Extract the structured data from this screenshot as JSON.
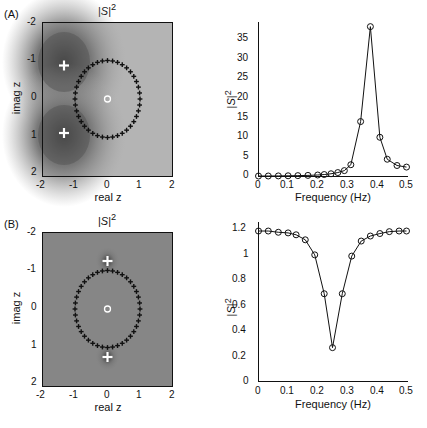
{
  "figure": {
    "panels": [
      {
        "letter": "(A)",
        "zplane": {
          "title": "|S|^2",
          "xlabel": "real z",
          "ylabel": "imag z",
          "xticks": [
            "-2",
            "-1",
            "0",
            "1",
            "2"
          ],
          "yticks": [
            "-2",
            "-1",
            "0",
            "1",
            "2"
          ],
          "xlim": [
            -2,
            2
          ],
          "ylim": [
            -2,
            2
          ],
          "y_inverted": true,
          "background": "grayscale |S|^2 magnitude map, dark near poles",
          "unit_circle_marker": "+",
          "unit_circle_count": 40,
          "zero_marker": "o",
          "zeros": [
            [
              0,
              0
            ]
          ],
          "pole_marker": "+",
          "pole_color": "#ffffff",
          "poles": [
            [
              -0.72,
              -0.9
            ],
            [
              -0.72,
              0.9
            ]
          ]
        },
        "spectrum": {
          "title": "",
          "xlabel": "Frequency (Hz)",
          "ylabel": "|S|^2",
          "xticks": [
            0,
            0.1,
            0.2,
            0.3,
            0.4,
            0.5
          ],
          "yticks": [
            0,
            5,
            10,
            15,
            20,
            25,
            30,
            35
          ],
          "xlim": [
            0,
            0.5
          ],
          "ylim": [
            0,
            39
          ]
        }
      },
      {
        "letter": "(B)",
        "zplane": {
          "title": "|S|^2",
          "xlabel": "real z",
          "ylabel": "imag z",
          "xticks": [
            "-2",
            "-1",
            "0",
            "1",
            "2"
          ],
          "yticks": [
            "-2",
            "-1",
            "0",
            "1",
            "2"
          ],
          "xlim": [
            -2,
            2
          ],
          "ylim": [
            -2,
            2
          ],
          "y_inverted": true,
          "background": "grayscale |S|^2 magnitude map, nearly uniform mid-gray",
          "unit_circle_marker": "+",
          "unit_circle_count": 40,
          "zero_marker": "o",
          "zeros": [
            [
              0,
              0
            ]
          ],
          "pole_marker": "+",
          "pole_color": "#ffffff",
          "poles": [
            [
              0,
              -1.25
            ],
            [
              0,
              1.25
            ]
          ]
        },
        "spectrum": {
          "title": "",
          "xlabel": "Frequency (Hz)",
          "ylabel": "|S|^2",
          "xticks": [
            0,
            0.1,
            0.2,
            0.3,
            0.4,
            0.5
          ],
          "yticks": [
            0,
            0.2,
            0.4,
            0.6,
            0.8,
            1,
            1.2
          ],
          "xlim": [
            0,
            0.5
          ],
          "ylim": [
            0,
            1.26
          ]
        }
      }
    ]
  },
  "chart_data": [
    {
      "type": "line",
      "panel": "(A)",
      "subplot": "spectrum",
      "title": "",
      "xlabel": "Frequency (Hz)",
      "ylabel": "|S|^2",
      "xlim": [
        0,
        0.5
      ],
      "ylim": [
        0,
        39
      ],
      "xticks": [
        0,
        0.1,
        0.2,
        0.3,
        0.4,
        0.5
      ],
      "yticks": [
        0,
        5,
        10,
        15,
        20,
        25,
        30,
        35
      ],
      "grid": false,
      "legend": null,
      "marker": "o",
      "x": [
        0.0,
        0.033,
        0.067,
        0.1,
        0.133,
        0.167,
        0.2,
        0.222,
        0.245,
        0.268,
        0.29,
        0.312,
        0.345,
        0.378,
        0.41,
        0.435,
        0.468,
        0.5
      ],
      "values": [
        0.12,
        0.13,
        0.15,
        0.18,
        0.22,
        0.28,
        0.38,
        0.5,
        0.7,
        1.0,
        1.5,
        3.0,
        14.0,
        38.2,
        10.0,
        4.4,
        2.8,
        2.4
      ],
      "annotations": [
        "sharp resonance peak near 0.378 Hz reaching about 38"
      ]
    },
    {
      "type": "line",
      "panel": "(B)",
      "subplot": "spectrum",
      "title": "",
      "xlabel": "Frequency (Hz)",
      "ylabel": "|S|^2",
      "xlim": [
        0,
        0.5
      ],
      "ylim": [
        0,
        1.26
      ],
      "xticks": [
        0,
        0.1,
        0.2,
        0.3,
        0.4,
        0.5
      ],
      "yticks": [
        0,
        0.2,
        0.4,
        0.6,
        0.8,
        1.0,
        1.2
      ],
      "grid": false,
      "legend": null,
      "marker": "o",
      "x": [
        0.0,
        0.033,
        0.067,
        0.1,
        0.127,
        0.158,
        0.19,
        0.222,
        0.25,
        0.283,
        0.315,
        0.347,
        0.378,
        0.41,
        0.442,
        0.475,
        0.5
      ],
      "values": [
        1.2,
        1.2,
        1.19,
        1.185,
        1.17,
        1.13,
        1.01,
        0.7,
        0.27,
        0.7,
        1.0,
        1.12,
        1.16,
        1.18,
        1.195,
        1.2,
        1.2
      ],
      "annotations": [
        "notch minimum about 0.27 at 0.25 Hz, plateau at 1.2"
      ]
    }
  ]
}
